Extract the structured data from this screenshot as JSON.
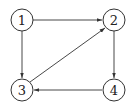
{
  "diagram": {
    "type": "directed-graph",
    "nodes": [
      {
        "id": "1",
        "label": "1",
        "cx": 22,
        "cy": 20
      },
      {
        "id": "2",
        "label": "2",
        "cx": 114,
        "cy": 20
      },
      {
        "id": "3",
        "label": "3",
        "cx": 22,
        "cy": 90
      },
      {
        "id": "4",
        "label": "4",
        "cx": 114,
        "cy": 90
      }
    ],
    "edges": [
      {
        "from": "1",
        "to": "2"
      },
      {
        "from": "1",
        "to": "3"
      },
      {
        "from": "3",
        "to": "2"
      },
      {
        "from": "2",
        "to": "4"
      },
      {
        "from": "4",
        "to": "3"
      }
    ],
    "node_radius": 11,
    "colors": {
      "stroke": "#333333",
      "text": "#222222",
      "background": "#ffffff"
    }
  }
}
